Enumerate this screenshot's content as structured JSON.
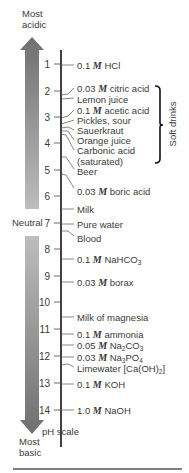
{
  "title_top": {
    "line1": "Most",
    "line2": "acidic"
  },
  "title_bottom": {
    "line1": "Most",
    "line2": "basic"
  },
  "axis_label": "pH scale",
  "neutral_label": "Neutral",
  "bracket_label": "Soft drinks",
  "colors": {
    "arrow_dark": "#7a7a7a",
    "arrow_light": "#b8b8b8",
    "axis": "#111111",
    "text": "#3a3a3a"
  },
  "ticks": [
    "1",
    "2",
    "3",
    "4",
    "5",
    "6",
    "7",
    "8",
    "9",
    "10",
    "11",
    "12",
    "13",
    "14"
  ],
  "substances": [
    {
      "pre": "0.1 ",
      "m": "M",
      "post": " HCl",
      "ph": 1.0
    },
    {
      "pre": "0.03 ",
      "m": "M",
      "post": " citric acid",
      "ph": 2.1
    },
    {
      "pre": "Lemon juice",
      "ph": 2.3
    },
    {
      "pre": "0.1 ",
      "m": "M",
      "post": " acetic acid",
      "ph": 2.9
    },
    {
      "pre": "Pickles, sour",
      "ph": 3.2
    },
    {
      "pre": "Sauerkraut",
      "ph": 3.5
    },
    {
      "pre": "Orange juice",
      "ph": 3.7
    },
    {
      "pre": "Carbonic acid",
      "ph": 3.8
    },
    {
      "pre": "(saturated)",
      "ph": 4.0
    },
    {
      "pre": "Beer",
      "ph": 4.5
    },
    {
      "pre": "0.03 ",
      "m": "M",
      "post": " boric acid",
      "ph": 5.2
    },
    {
      "pre": "Milk",
      "ph": 6.5
    },
    {
      "pre": "Pure water",
      "ph": 7.0
    },
    {
      "pre": "Blood",
      "ph": 7.4
    },
    {
      "pre": "0.1 ",
      "m": "M",
      "post": " NaHCO",
      "sub": "3",
      "ph": 8.4
    },
    {
      "pre": "0.03 ",
      "m": "M",
      "post": " borax",
      "ph": 9.2
    },
    {
      "pre": "Milk of magnesia",
      "ph": 10.5
    },
    {
      "pre": "0.1 ",
      "m": "M",
      "post": " ammonia",
      "ph": 11.1
    },
    {
      "pre": "0.05 ",
      "m": "M",
      "post": " Na",
      "sub": "2",
      "post2": "CO",
      "sub2": "3",
      "ph": 11.6
    },
    {
      "pre": "0.03 ",
      "m": "M",
      "post": " Na",
      "sub": "3",
      "post2": "PO",
      "sub2": "4",
      "ph": 12.0
    },
    {
      "pre": "Limewater [Ca(OH)",
      "sub": "2",
      "post2": "]",
      "ph": 12.4
    },
    {
      "pre": "0.1 ",
      "m": "M",
      "post": " KOH",
      "ph": 13.0
    },
    {
      "pre": "1.0 ",
      "m": "M",
      "post": " NaOH",
      "ph": 14.0
    }
  ]
}
